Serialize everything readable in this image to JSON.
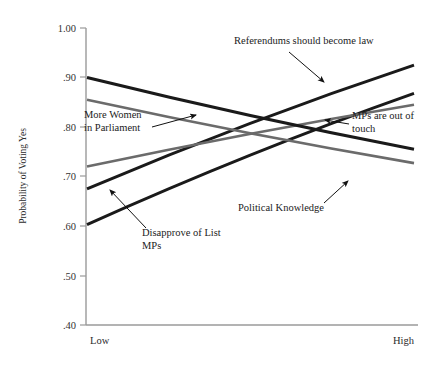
{
  "chart_data": {
    "type": "line",
    "title": "",
    "xlabel": "",
    "ylabel": "Probability of Voting Yes",
    "x": [
      "Low",
      "High"
    ],
    "xtick_labels": [
      "Low",
      "High"
    ],
    "ytick_labels": [
      "1.00",
      ".90",
      ".80",
      ".70",
      ".60",
      ".50",
      ".40"
    ],
    "ytick_values": [
      1.0,
      0.9,
      0.8,
      0.7,
      0.6,
      0.5,
      0.4
    ],
    "ylim": [
      0.4,
      1.0
    ],
    "grid": false,
    "legend_position": "inline-annotations",
    "series": [
      {
        "name": "Referendums should become law",
        "values": [
          0.675,
          0.925
        ],
        "color": "#1a1a1a",
        "width": 3.0
      },
      {
        "name": "Disapprove of List MPs",
        "values": [
          0.603,
          0.868
        ],
        "color": "#1a1a1a",
        "width": 3.0
      },
      {
        "name": "MPs are out of touch",
        "values": [
          0.72,
          0.845
        ],
        "color": "#6b6b6b",
        "width": 2.6
      },
      {
        "name": "More Women in Parliament",
        "values": [
          0.9,
          0.755
        ],
        "color": "#1a1a1a",
        "width": 3.0
      },
      {
        "name": "Political Knowledge",
        "values": [
          0.855,
          0.727
        ],
        "color": "#6b6b6b",
        "width": 2.6
      }
    ],
    "annotations": [
      {
        "id": "more-women-in-parliament",
        "lines": [
          "More Women",
          "in Parliament"
        ],
        "text_x": 84,
        "text_y": 118,
        "arrow": {
          "x1": 152,
          "y1": 127,
          "x2": 196,
          "y2": 115
        }
      },
      {
        "id": "referendums-should-become-law",
        "lines": [
          "Referendums should become law"
        ],
        "text_x": 234,
        "text_y": 44,
        "arrow": {
          "x1": 289,
          "y1": 52,
          "x2": 324,
          "y2": 82
        }
      },
      {
        "id": "mps-are-out-of-touch",
        "lines": [
          "MPs are out of",
          "touch"
        ],
        "text_x": 352,
        "text_y": 119,
        "arrow": {
          "x1": 349,
          "y1": 124,
          "x2": 325,
          "y2": 120
        }
      },
      {
        "id": "disapprove-of-list-mps",
        "lines": [
          "Disapprove of List",
          "MPs"
        ],
        "text_x": 142,
        "text_y": 236,
        "arrow": {
          "x1": 146,
          "y1": 228,
          "x2": 110,
          "y2": 190
        }
      },
      {
        "id": "political-knowledge",
        "lines": [
          "Political Knowledge"
        ],
        "text_x": 238,
        "text_y": 211,
        "arrow": {
          "x1": 324,
          "y1": 203,
          "x2": 348,
          "y2": 181
        }
      }
    ]
  },
  "axes": {
    "x_low_label": "Low",
    "x_high_label": "High",
    "y_axis_title": "Probability of Voting Yes"
  }
}
